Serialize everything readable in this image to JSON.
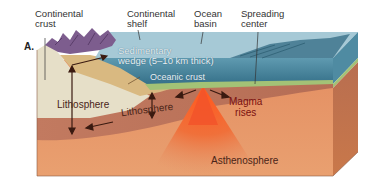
{
  "figure": {
    "panel_label": "A.",
    "labels": {
      "continental_crust": [
        "Continental",
        "crust"
      ],
      "continental_shelf": [
        "Continental",
        "shelf"
      ],
      "ocean_basin": [
        "Ocean",
        "basin"
      ],
      "spreading_center": [
        "Spreading",
        "center"
      ],
      "sedimentary_wedge": [
        "Sedimentary",
        "wedge (5–10 km thick)"
      ],
      "oceanic_crust": "Oceanic crust",
      "lithosphere_left": "Lithosphere",
      "lithosphere_right": "Lithosphere",
      "magma_rises": [
        "Magma",
        "rises"
      ],
      "asthenosphere": "Asthenosphere"
    },
    "colors": {
      "ocean": "#3f7f97",
      "ocean_top": "#8fb8c8",
      "continental_crust": "#e4dcc4",
      "lithosphere": "#b8735a",
      "asthenosphere": "#e0875a",
      "magma": "#f05a2a",
      "oceanic_crust": "#9cc070",
      "mountains": "#7a5a8a",
      "sediment": "#d8b878"
    }
  }
}
